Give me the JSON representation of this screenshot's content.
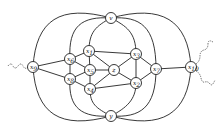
{
  "diagram": {
    "type": "graph",
    "nodes": [
      {
        "id": "v",
        "label": "v",
        "sub": ""
      },
      {
        "id": "y",
        "label": "y",
        "sub": ""
      },
      {
        "id": "x9",
        "label": "x",
        "sub": "9"
      },
      {
        "id": "x10",
        "label": "x",
        "sub": "10"
      },
      {
        "id": "x6",
        "label": "x",
        "sub": "6"
      },
      {
        "id": "x8",
        "label": "x",
        "sub": "8"
      },
      {
        "id": "x1",
        "label": "x",
        "sub": "1"
      },
      {
        "id": "x5",
        "label": "x",
        "sub": "5"
      },
      {
        "id": "x4",
        "label": "x",
        "sub": "4"
      },
      {
        "id": "z",
        "label": "z",
        "sub": ""
      },
      {
        "id": "x3",
        "label": "x",
        "sub": "3"
      },
      {
        "id": "x2",
        "label": "x",
        "sub": "2"
      },
      {
        "id": "x7",
        "label": "x",
        "sub": "7"
      }
    ],
    "edges": [
      [
        "x9",
        "x6"
      ],
      [
        "x9",
        "x8"
      ],
      [
        "x7",
        "x10"
      ],
      [
        "x6",
        "x8"
      ],
      [
        "x6",
        "x1"
      ],
      [
        "x6",
        "x5"
      ],
      [
        "x8",
        "x5"
      ],
      [
        "x8",
        "x4"
      ],
      [
        "x1",
        "x5"
      ],
      [
        "x1",
        "x3"
      ],
      [
        "x1",
        "z"
      ],
      [
        "x5",
        "z"
      ],
      [
        "x5",
        "x4"
      ],
      [
        "x4",
        "z"
      ],
      [
        "x4",
        "x2"
      ],
      [
        "z",
        "x3"
      ],
      [
        "z",
        "x2"
      ],
      [
        "x3",
        "x7"
      ],
      [
        "x2",
        "x7"
      ],
      [
        "x3",
        "x2"
      ]
    ],
    "curved_edges": [
      [
        "v",
        "x9"
      ],
      [
        "v",
        "x10"
      ],
      [
        "y",
        "x9"
      ],
      [
        "y",
        "x10"
      ],
      [
        "v",
        "x6"
      ],
      [
        "v",
        "x7"
      ],
      [
        "y",
        "x8"
      ],
      [
        "y",
        "x7"
      ],
      [
        "v",
        "x1"
      ],
      [
        "v",
        "x3"
      ],
      [
        "y",
        "x4"
      ],
      [
        "y",
        "x2"
      ]
    ],
    "external_wavy": [
      "x9",
      "x10"
    ]
  }
}
